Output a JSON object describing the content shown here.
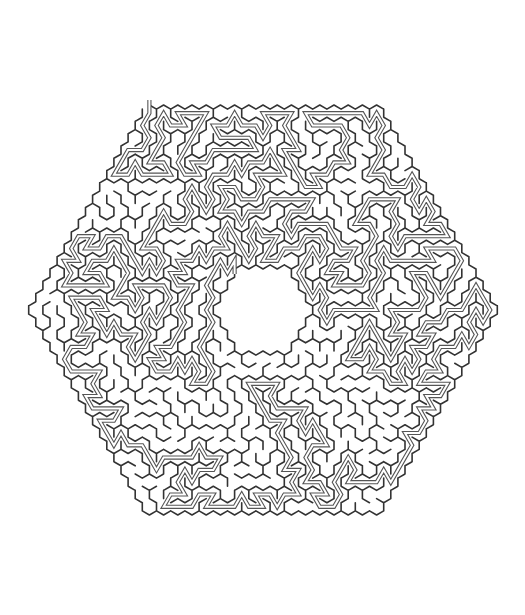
{
  "puzzle": {
    "type": "hexagonal-maze",
    "cell_shape": "pointy-top-hexagon",
    "outline_shape": "hexagon",
    "has_center_hole": true,
    "has_solution_path": true,
    "entrance": "top",
    "goal": "center"
  },
  "geometry": {
    "center_x": 263,
    "center_y": 310,
    "cell_size": 8.2,
    "rings": 16,
    "hole_rings": 3,
    "seed": 20240611
  },
  "colors": {
    "background": "#ffffff",
    "wall": "#333333",
    "solution_outline": "#555555",
    "solution_fill": "#ffffff"
  }
}
